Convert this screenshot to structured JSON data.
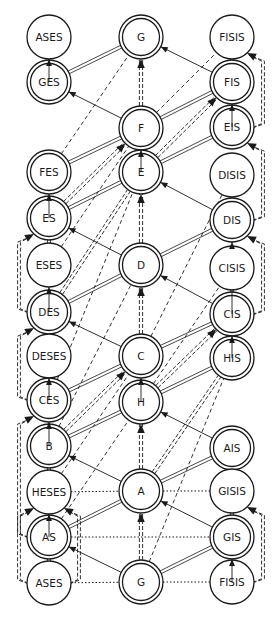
{
  "diagram": {
    "radius": 22,
    "colors": {
      "stroke": "#1a1a1a",
      "background": "#ffffff"
    },
    "nodes": [
      {
        "id": "ases_top",
        "label": "ASES",
        "x": 49,
        "y": 37,
        "double": false
      },
      {
        "id": "ges",
        "label": "GES",
        "x": 49,
        "y": 82,
        "double": true
      },
      {
        "id": "fes",
        "label": "FES",
        "x": 49,
        "y": 172,
        "double": true
      },
      {
        "id": "es",
        "label": "ES",
        "x": 49,
        "y": 218,
        "double": true
      },
      {
        "id": "eses",
        "label": "ESES",
        "x": 49,
        "y": 265,
        "double": false
      },
      {
        "id": "des",
        "label": "DES",
        "x": 49,
        "y": 312,
        "double": true
      },
      {
        "id": "deses",
        "label": "DESES",
        "x": 49,
        "y": 356,
        "double": false
      },
      {
        "id": "ces",
        "label": "CES",
        "x": 49,
        "y": 400,
        "double": true
      },
      {
        "id": "b",
        "label": "B",
        "x": 49,
        "y": 446,
        "double": true
      },
      {
        "id": "heses",
        "label": "HESES",
        "x": 49,
        "y": 492,
        "double": false
      },
      {
        "id": "as",
        "label": "AS",
        "x": 49,
        "y": 537,
        "double": true
      },
      {
        "id": "ases_bot",
        "label": "ASES",
        "x": 49,
        "y": 583,
        "double": false
      },
      {
        "id": "g_top",
        "label": "G",
        "x": 141,
        "y": 37,
        "double": true
      },
      {
        "id": "f",
        "label": "F",
        "x": 141,
        "y": 128,
        "double": true
      },
      {
        "id": "e",
        "label": "E",
        "x": 141,
        "y": 172,
        "double": true
      },
      {
        "id": "d",
        "label": "D",
        "x": 141,
        "y": 265,
        "double": true
      },
      {
        "id": "c",
        "label": "C",
        "x": 141,
        "y": 356,
        "double": true
      },
      {
        "id": "h",
        "label": "H",
        "x": 141,
        "y": 402,
        "double": true
      },
      {
        "id": "a",
        "label": "A",
        "x": 141,
        "y": 491,
        "double": true
      },
      {
        "id": "g_bot",
        "label": "G",
        "x": 141,
        "y": 582,
        "double": true
      },
      {
        "id": "fisis_top",
        "label": "FISIS",
        "x": 232,
        "y": 37,
        "double": false
      },
      {
        "id": "fis",
        "label": "FIS",
        "x": 232,
        "y": 82,
        "double": true
      },
      {
        "id": "eis",
        "label": "EIS",
        "x": 232,
        "y": 127,
        "double": true
      },
      {
        "id": "disis",
        "label": "DISIS",
        "x": 232,
        "y": 175,
        "double": false
      },
      {
        "id": "dis",
        "label": "DIS",
        "x": 232,
        "y": 220,
        "double": true
      },
      {
        "id": "cisis",
        "label": "CISIS",
        "x": 232,
        "y": 268,
        "double": false
      },
      {
        "id": "cis",
        "label": "CIS",
        "x": 232,
        "y": 314,
        "double": true
      },
      {
        "id": "his",
        "label": "HIS",
        "x": 232,
        "y": 358,
        "double": true
      },
      {
        "id": "ais",
        "label": "AIS",
        "x": 232,
        "y": 448,
        "double": true
      },
      {
        "id": "gisis",
        "label": "GISIS",
        "x": 232,
        "y": 491,
        "double": false
      },
      {
        "id": "gis",
        "label": "GIS",
        "x": 232,
        "y": 537,
        "double": true
      },
      {
        "id": "fisis_bot",
        "label": "FISIS",
        "x": 232,
        "y": 582,
        "double": false
      }
    ],
    "edges": [
      {
        "from": "ges",
        "to": "ases_top",
        "style": "thin",
        "arrow": true
      },
      {
        "from": "fes",
        "to": "ges",
        "style": "none",
        "arrow": false
      },
      {
        "from": "es",
        "to": "fes",
        "style": "thin",
        "arrow": true
      },
      {
        "from": "eses",
        "to": "es",
        "style": "double",
        "arrow": false
      },
      {
        "from": "des",
        "to": "eses",
        "style": "thin",
        "arrow": true
      },
      {
        "from": "deses",
        "to": "des",
        "style": "double",
        "arrow": false
      },
      {
        "from": "ces",
        "to": "deses",
        "style": "thin",
        "arrow": true
      },
      {
        "from": "b",
        "to": "ces",
        "style": "thin",
        "arrow": true
      },
      {
        "from": "heses",
        "to": "b",
        "style": "double",
        "arrow": false
      },
      {
        "from": "as",
        "to": "heses",
        "style": "thin",
        "arrow": true
      },
      {
        "from": "ases_bot",
        "to": "as",
        "style": "double",
        "arrow": false
      },
      {
        "from": "f",
        "to": "g_top",
        "style": "dashdouble",
        "arrow": true
      },
      {
        "from": "e",
        "to": "f",
        "style": "thin",
        "arrow": true
      },
      {
        "from": "d",
        "to": "e",
        "style": "dashdouble",
        "arrow": true
      },
      {
        "from": "c",
        "to": "d",
        "style": "dashdouble",
        "arrow": true
      },
      {
        "from": "h",
        "to": "c",
        "style": "thin",
        "arrow": true
      },
      {
        "from": "a",
        "to": "h",
        "style": "dashdouble",
        "arrow": true
      },
      {
        "from": "g_bot",
        "to": "a",
        "style": "dashdouble",
        "arrow": true
      },
      {
        "from": "fis",
        "to": "fisis_top",
        "style": "double",
        "arrow": false
      },
      {
        "from": "eis",
        "to": "fis",
        "style": "thin",
        "arrow": true
      },
      {
        "from": "dis",
        "to": "eis",
        "style": "none",
        "arrow": false
      },
      {
        "from": "disis",
        "to": "dis",
        "style": "double",
        "arrow": false
      },
      {
        "from": "cis",
        "to": "dis",
        "style": "thin",
        "arrow": true
      },
      {
        "from": "cisis",
        "to": "cis",
        "style": "double",
        "arrow": false
      },
      {
        "from": "his",
        "to": "cis",
        "style": "thin",
        "arrow": true
      },
      {
        "from": "gisis",
        "to": "ais",
        "style": "double",
        "arrow": false
      },
      {
        "from": "gis",
        "to": "ais",
        "style": "none",
        "arrow": false
      },
      {
        "from": "fisis_bot",
        "to": "gis",
        "style": "thin",
        "arrow": true
      },
      {
        "from": "gis",
        "to": "gisis",
        "style": "double",
        "arrow": false
      },
      {
        "from": "ges",
        "to": "g_top",
        "style": "double",
        "arrow": false
      },
      {
        "from": "f",
        "to": "ges",
        "style": "thin",
        "arrow": true
      },
      {
        "from": "fis",
        "to": "g_top",
        "style": "thin",
        "arrow": true
      },
      {
        "from": "f",
        "to": "fis",
        "style": "double",
        "arrow": false
      },
      {
        "from": "fes",
        "to": "f",
        "style": "double",
        "arrow": false
      },
      {
        "from": "e",
        "to": "eis",
        "style": "double",
        "arrow": false
      },
      {
        "from": "es",
        "to": "e",
        "style": "double",
        "arrow": false
      },
      {
        "from": "d",
        "to": "es",
        "style": "thin",
        "arrow": true
      },
      {
        "from": "dis",
        "to": "e",
        "style": "thin",
        "arrow": true
      },
      {
        "from": "d",
        "to": "dis",
        "style": "double",
        "arrow": false
      },
      {
        "from": "des",
        "to": "d",
        "style": "double",
        "arrow": false
      },
      {
        "from": "cis",
        "to": "d",
        "style": "thin",
        "arrow": true
      },
      {
        "from": "c",
        "to": "des",
        "style": "thin",
        "arrow": true
      },
      {
        "from": "c",
        "to": "cis",
        "style": "double",
        "arrow": false
      },
      {
        "from": "ces",
        "to": "c",
        "style": "double",
        "arrow": false
      },
      {
        "from": "h",
        "to": "his",
        "style": "double",
        "arrow": false
      },
      {
        "from": "b",
        "to": "h",
        "style": "double",
        "arrow": false
      },
      {
        "from": "ais",
        "to": "h",
        "style": "thin",
        "arrow": true
      },
      {
        "from": "a",
        "to": "b",
        "style": "thin",
        "arrow": true
      },
      {
        "from": "a",
        "to": "ais",
        "style": "double",
        "arrow": false
      },
      {
        "from": "as",
        "to": "a",
        "style": "double",
        "arrow": false
      },
      {
        "from": "gis",
        "to": "a",
        "style": "thin",
        "arrow": true
      },
      {
        "from": "g_bot",
        "to": "as",
        "style": "thin",
        "arrow": true
      },
      {
        "from": "g_bot",
        "to": "gis",
        "style": "double",
        "arrow": false
      },
      {
        "from": "heses",
        "to": "a",
        "style": "dot",
        "arrow": false
      },
      {
        "from": "a",
        "to": "gisis",
        "style": "dot",
        "arrow": false
      },
      {
        "from": "as",
        "to": "gis",
        "style": "dot",
        "arrow": false
      },
      {
        "from": "ases_bot",
        "to": "g_bot",
        "style": "dot",
        "arrow": false
      },
      {
        "from": "g_bot",
        "to": "fisis_bot",
        "style": "dot",
        "arrow": false
      },
      {
        "from": "fes",
        "to": "g_top",
        "style": "dash",
        "arrow": false
      },
      {
        "from": "f",
        "to": "fisis_top",
        "style": "dash",
        "arrow": false
      },
      {
        "from": "ces",
        "to": "e",
        "style": "dash",
        "arrow": false
      },
      {
        "from": "eses",
        "to": "f",
        "style": "dash",
        "arrow": false
      },
      {
        "from": "c",
        "to": "disis",
        "style": "dash",
        "arrow": false
      },
      {
        "from": "b",
        "to": "d",
        "style": "dash",
        "arrow": false
      },
      {
        "from": "h",
        "to": "cisis",
        "style": "dash",
        "arrow": false
      },
      {
        "from": "g_bot",
        "to": "his",
        "style": "dash",
        "arrow": false
      },
      {
        "from": "heses",
        "to": "c",
        "style": "dash",
        "arrow": false
      },
      {
        "from": "as",
        "to": "h",
        "style": "dash",
        "arrow": false
      },
      {
        "from": "es",
        "to": "f",
        "style": "dashdouble",
        "arrow": true
      },
      {
        "from": "e",
        "to": "fis",
        "style": "dashdouble",
        "arrow": true
      },
      {
        "from": "des",
        "to": "e",
        "style": "dashdouble",
        "arrow": false
      },
      {
        "from": "h",
        "to": "cis",
        "style": "dashdouble",
        "arrow": true
      },
      {
        "from": "b",
        "to": "c",
        "style": "dashdouble",
        "arrow": true
      },
      {
        "from": "a",
        "to": "his",
        "style": "dashdouble",
        "arrow": false
      }
    ],
    "arcs": [
      {
        "side": "left",
        "from": "des",
        "to": "es",
        "arrow": true
      },
      {
        "side": "left",
        "from": "ces",
        "to": "des",
        "arrow": true
      },
      {
        "side": "left",
        "from": "as",
        "to": "ces",
        "arrow": true
      },
      {
        "side": "left",
        "from": "ases_bot",
        "to": "heses",
        "arrow": true
      },
      {
        "side": "leftinner",
        "from": "ases_bot",
        "to": "heses",
        "arrow": true
      },
      {
        "side": "right",
        "from": "eis",
        "to": "fisis_top",
        "arrow": true
      },
      {
        "side": "right",
        "from": "dis",
        "to": "eis",
        "arrow": true
      },
      {
        "side": "right",
        "from": "cis",
        "to": "dis",
        "arrow": true
      },
      {
        "side": "right",
        "from": "fisis_bot",
        "to": "gisis",
        "arrow": true
      }
    ]
  }
}
